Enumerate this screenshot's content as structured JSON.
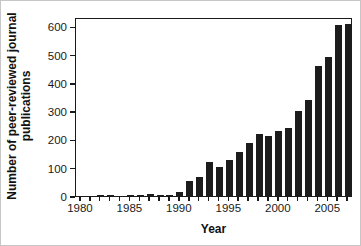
{
  "figure": {
    "background": "#ffffff",
    "border_color": "#c6c6c6"
  },
  "chart_data": {
    "type": "bar",
    "title": "",
    "xlabel": "Year",
    "ylabel": "Number of peer-reviewed journal publications",
    "ylabel_lines": [
      "Number of peer-reviewed journal",
      "publications"
    ],
    "x": [
      1980,
      1981,
      1982,
      1983,
      1984,
      1985,
      1986,
      1987,
      1988,
      1989,
      1990,
      1991,
      1992,
      1993,
      1994,
      1995,
      1996,
      1997,
      1998,
      1999,
      2000,
      2001,
      2002,
      2003,
      2004,
      2005,
      2006,
      2007
    ],
    "values": [
      0,
      0,
      5,
      5,
      0,
      2,
      5,
      6,
      5,
      4,
      13,
      52,
      68,
      121,
      102,
      127,
      155,
      188,
      221,
      214,
      229,
      239,
      299,
      339,
      461,
      490,
      606,
      610
    ],
    "yticks": [
      0,
      100,
      200,
      300,
      400,
      500,
      600
    ],
    "xtick_labels": [
      1980,
      1985,
      1990,
      1995,
      2000,
      2005
    ],
    "ylim": [
      0,
      633
    ],
    "grid": false,
    "legend": null,
    "bar_color": "#1c1c1c",
    "axis_color": "#1a1a1a"
  }
}
